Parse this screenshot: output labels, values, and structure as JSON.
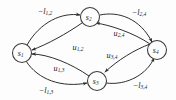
{
  "figure": {
    "kind": "directed-graph",
    "background_color": "#fdfdfd",
    "stroke_color": "#2e2e2e",
    "text_color": "#1a1a1a"
  },
  "nodes": [
    {
      "id": "s1",
      "base": "s",
      "sub": "1",
      "x": 22,
      "y": 53,
      "r": 9.5
    },
    {
      "id": "s2",
      "base": "s",
      "sub": "2",
      "x": 90,
      "y": 17,
      "r": 9.5
    },
    {
      "id": "s3",
      "base": "s",
      "sub": "3",
      "x": 97,
      "y": 81,
      "r": 9.5
    },
    {
      "id": "s4",
      "base": "s",
      "sub": "4",
      "x": 157,
      "y": 50,
      "r": 9.5
    }
  ],
  "edges": [
    {
      "name": "edge-s1-s2-lower",
      "from": "s1",
      "to": "s2",
      "label_base": "−l",
      "label_sub": "1,2",
      "label_x": 45,
      "label_y": 11,
      "path": "M 27 45 C 40 22, 62 12, 80 15"
    },
    {
      "name": "edge-s2-s1-upper",
      "from": "s2",
      "to": "s1",
      "label_base": "u",
      "label_sub": "1,2",
      "label_x": 78,
      "label_y": 47,
      "path": "M 82 23 C 66 34, 48 44, 32 50"
    },
    {
      "name": "edge-s2-s4-lower",
      "from": "s2",
      "to": "s4",
      "label_base": "−l",
      "label_sub": "2,4",
      "label_x": 139,
      "label_y": 12,
      "path": "M 100 15 C 118 11, 140 18, 152 42"
    },
    {
      "name": "edge-s4-s2-upper",
      "from": "s4",
      "to": "s2",
      "label_base": "u",
      "label_sub": "2,4",
      "label_x": 119,
      "label_y": 33,
      "path": "M 150 44 C 134 33, 110 25, 96 23"
    },
    {
      "name": "edge-s1-s3-lower",
      "from": "s1",
      "to": "s3",
      "label_base": "−l",
      "label_sub": "1,3",
      "label_x": 46,
      "label_y": 90,
      "path": "M 26 61 C 38 80, 62 88, 87 83"
    },
    {
      "name": "edge-s3-s1-upper",
      "from": "s3",
      "to": "s1",
      "label_base": "u",
      "label_sub": "1,3",
      "label_x": 59,
      "label_y": 68,
      "path": "M 89 76 C 72 64, 48 54, 32 54"
    },
    {
      "name": "edge-s3-s4-lower",
      "from": "s3",
      "to": "s4",
      "label_base": "−l",
      "label_sub": "3,4",
      "label_x": 140,
      "label_y": 85,
      "path": "M 106 83 C 128 86, 148 73, 154 58"
    },
    {
      "name": "edge-s4-s3-upper",
      "from": "s4",
      "to": "s3",
      "label_base": "u",
      "label_sub": "3,4",
      "label_x": 112,
      "label_y": 55,
      "path": "M 150 44 C 134 50, 118 60, 105 72"
    }
  ]
}
